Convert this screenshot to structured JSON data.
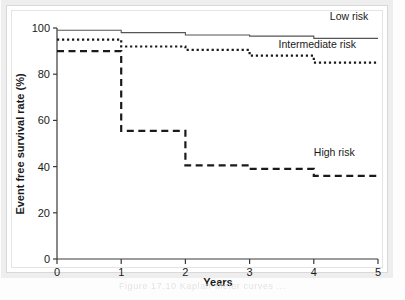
{
  "figure": {
    "caption": "Figure 17.10  Kaplan-Meier curves ...",
    "background_color": "#ffffff",
    "frame_color": "#eeeeee"
  },
  "chart_data": {
    "type": "line",
    "title": "",
    "subtitle": "",
    "xlabel": "Years",
    "ylabel": "Event free survival rate (%)",
    "xlim": [
      0,
      5
    ],
    "ylim": [
      0,
      100
    ],
    "xticks": [
      0,
      1,
      2,
      3,
      4,
      5
    ],
    "yticks": [
      0,
      20,
      40,
      60,
      80,
      100
    ],
    "xtick_labels": [
      "0",
      "1",
      "2",
      "3",
      "4",
      "5"
    ],
    "ytick_labels": [
      "0",
      "20",
      "40",
      "60",
      "80",
      "100"
    ],
    "grid": false,
    "legend_position": "inline-right",
    "step_mode": "post",
    "series": [
      {
        "name": "Low risk",
        "label": "Low risk",
        "style": "solid",
        "color": "#555555",
        "width": 1.1,
        "x": [
          0,
          1,
          2,
          3,
          4,
          5
        ],
        "values": [
          99,
          98,
          97,
          96.5,
          95.5,
          95.5
        ],
        "label_x": 4.25,
        "label_y": 103.5
      },
      {
        "name": "Intermediate risk",
        "label": "Intermediate risk",
        "style": "dotted",
        "color": "#1a1a1a",
        "width": 2.2,
        "dash": "2.2 2.8",
        "x": [
          0,
          1,
          2,
          3,
          4,
          5
        ],
        "values": [
          95,
          92,
          90.5,
          88,
          85,
          85
        ],
        "label_x": 3.45,
        "label_y": 91.5
      },
      {
        "name": "High risk",
        "label": "High risk",
        "style": "dashed",
        "color": "#1a1a1a",
        "width": 2.2,
        "dash": "7 4.5",
        "x": [
          0,
          1,
          2,
          3,
          4,
          5
        ],
        "values": [
          90,
          55.5,
          40.5,
          39,
          36,
          36
        ],
        "label_x": 4.0,
        "label_y": 44.5
      }
    ]
  },
  "axes": {
    "x_axis_name": "x-axis",
    "y_axis_name": "y-axis"
  }
}
